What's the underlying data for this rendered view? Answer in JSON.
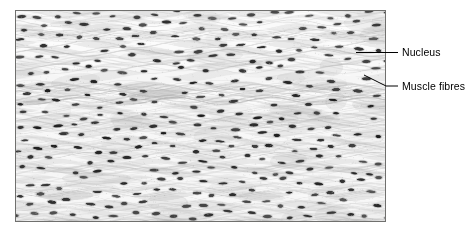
{
  "figure": {
    "name": "skeletal-muscle-longitudinal-section",
    "outer_background": "#ffffff",
    "panel": {
      "border_color": "#70706e",
      "base_color": "#e9e9e9",
      "highlight_color": "#fdfdfd",
      "striation_color": "#c9c9c9",
      "nucleus_color": "#2b2b2b",
      "x": 15,
      "y": 10,
      "width": 371,
      "height": 212
    }
  },
  "callouts": [
    {
      "id": "nucleus",
      "label": "Nucleus",
      "leader_type": "straight",
      "leader_color": "#000000",
      "anchor_x": 356,
      "anchor_y": 52,
      "elbow_x": 386,
      "elbow_y": 52,
      "end_x": 398,
      "end_y": 52
    },
    {
      "id": "muscle-fibres",
      "label": "Muscle fibres",
      "leader_type": "diagonal",
      "leader_color": "#000000",
      "anchor_x": 364,
      "anchor_y": 75,
      "elbow_x": 386,
      "elbow_y": 86,
      "end_x": 398,
      "end_y": 86
    }
  ],
  "micrograph": {
    "seed": 20240517,
    "nucleus_rows": 19,
    "nucleus_per_row": 19,
    "nucleus_rx": 3.6,
    "nucleus_ry": 1.3,
    "row_spacing": 11.2,
    "col_spacing": 19.6,
    "row_offset": 9.4,
    "wave_amplitude": 3.4,
    "wave_period": 96,
    "striation_count": 150,
    "fibre_band_count": 26
  }
}
